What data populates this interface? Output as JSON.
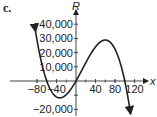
{
  "part_label": "c.",
  "chart_data": {
    "type": "line",
    "title": "",
    "xlabel": "x",
    "ylabel": "R",
    "x_ticks": [
      -80,
      -40,
      40,
      80,
      120
    ],
    "x_tick_labels": [
      "−80",
      "−40",
      "40",
      "80",
      "120"
    ],
    "y_ticks": [
      -20000,
      10000,
      20000,
      30000,
      40000
    ],
    "y_tick_labels": [
      "−20,000",
      "10,000",
      "20,000",
      "30,000",
      "40,000"
    ],
    "xlim": [
      -100,
      130
    ],
    "ylim": [
      -25000,
      45000
    ],
    "grid": false,
    "series": [
      {
        "name": "R(x)",
        "x": [
          -80,
          -60,
          -40,
          -20,
          0,
          20,
          40,
          60,
          80,
          100,
          110
        ],
        "values": [
          37000,
          0,
          -11500,
          -9000,
          0,
          13000,
          24000,
          28000,
          21000,
          0,
          -17000
        ]
      }
    ],
    "roots": [
      -60,
      0,
      100
    ],
    "local_min": {
      "x": -35,
      "y": -10500
    },
    "local_max": {
      "x": 55,
      "y": 28500
    }
  }
}
